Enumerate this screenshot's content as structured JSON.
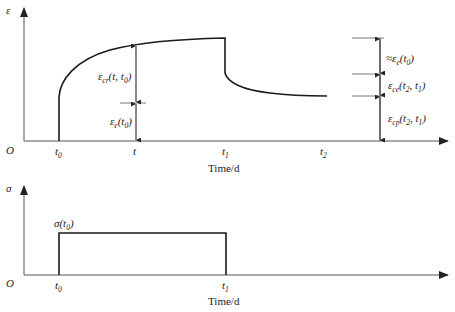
{
  "top_chart": {
    "y_axis_label": "ε",
    "origin_label": "O",
    "x_axis_label": "Time/d",
    "x_ticks": [
      {
        "base": "t",
        "sub": "0"
      },
      {
        "base": "t",
        "sub": ""
      },
      {
        "base": "t",
        "sub": "1"
      },
      {
        "base": "t",
        "sub": "2"
      }
    ],
    "annotations": {
      "creep_strain": {
        "base": "ε",
        "sub": "cr",
        "args": "(t, t",
        "argsub": "0",
        "close": ")"
      },
      "elastic_strain": {
        "base": "ε",
        "sub": "e",
        "args": "(t",
        "argsub": "0",
        "close": ")"
      },
      "approx_elastic_recovery": {
        "prefix": "≈",
        "base": "ε",
        "sub": "e",
        "args": "(t",
        "argsub": "0",
        "close": ")"
      },
      "creep_recovery": {
        "base": "ε",
        "sub": "ce",
        "args": "(t",
        "argsub": "2",
        "mid": ", t",
        "argsub2": "1",
        "close": ")"
      },
      "residual_creep": {
        "base": "ε",
        "sub": "cp",
        "args": "(t",
        "argsub": "2",
        "mid": ", t",
        "argsub2": "1",
        "close": ")"
      }
    }
  },
  "bottom_chart": {
    "y_axis_label": "σ",
    "origin_label": "O",
    "x_axis_label": "Time/d",
    "x_ticks": [
      {
        "base": "t",
        "sub": "0"
      },
      {
        "base": "t",
        "sub": "1"
      }
    ],
    "stress_label": {
      "base": "σ",
      "args": "(t",
      "argsub": "0",
      "close": ")"
    }
  },
  "colors": {
    "line": "#1a1a1a",
    "axis": "#555555",
    "background": "#ffffff"
  }
}
